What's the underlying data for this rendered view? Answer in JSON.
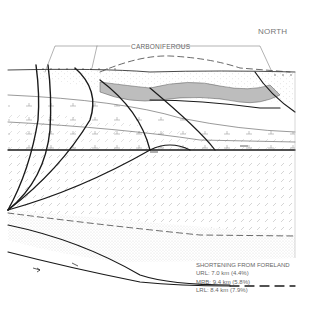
{
  "diagram": {
    "type": "geological cross-section",
    "orientation_label": "NORTH",
    "unit_label": "CARBONIFEROUS",
    "legend": {
      "title": "SHORTENING FROM FORELAND",
      "items": [
        {
          "label": "URL: 7.0 km (4.4%)"
        },
        {
          "label": "MRB: 9.4 km (5.8%)"
        },
        {
          "label": "LRL: 8.4 km (7.9%)"
        }
      ]
    },
    "colors": {
      "line": "#1a1a1a",
      "shaded_unit": "#bdbdbd",
      "stipple": "#cfcfcf",
      "text": "#666666"
    }
  }
}
